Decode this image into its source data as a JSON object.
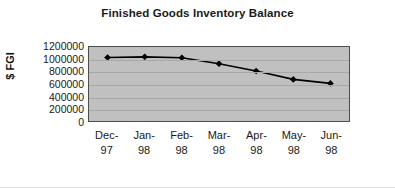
{
  "chart_data": {
    "type": "line",
    "title": "Finished Goods Inventory Balance",
    "xlabel": "",
    "ylabel": "$ FGI",
    "categories": [
      "Dec-97",
      "Jan-98",
      "Feb-98",
      "Mar-98",
      "Apr-98",
      "May-98",
      "Jun-98"
    ],
    "category_lines": [
      [
        "Dec-",
        "97"
      ],
      [
        "Jan-",
        "98"
      ],
      [
        "Feb-",
        "98"
      ],
      [
        "Mar-",
        "98"
      ],
      [
        "Apr-",
        "98"
      ],
      [
        "May-",
        "98"
      ],
      [
        "Jun-",
        "98"
      ]
    ],
    "values": [
      1030000,
      1040000,
      1025000,
      930000,
      810000,
      675000,
      610000
    ],
    "ylim": [
      0,
      1200000
    ],
    "yticks": [
      1200000,
      1000000,
      800000,
      600000,
      400000,
      200000,
      0
    ],
    "ytick_labels": [
      "1200000",
      "1000000",
      "800000",
      "600000",
      "400000",
      "200000",
      "0"
    ],
    "grid": true,
    "legend": "none",
    "marker": "diamond",
    "colors": {
      "line": "#000000",
      "marker": "#000000",
      "plot_background": "#c0c0c0",
      "gridline": "#a8a8a8",
      "plot_border": "#4d4d4d",
      "text": "#1a1a1a",
      "page_background": "#ffffff"
    }
  }
}
